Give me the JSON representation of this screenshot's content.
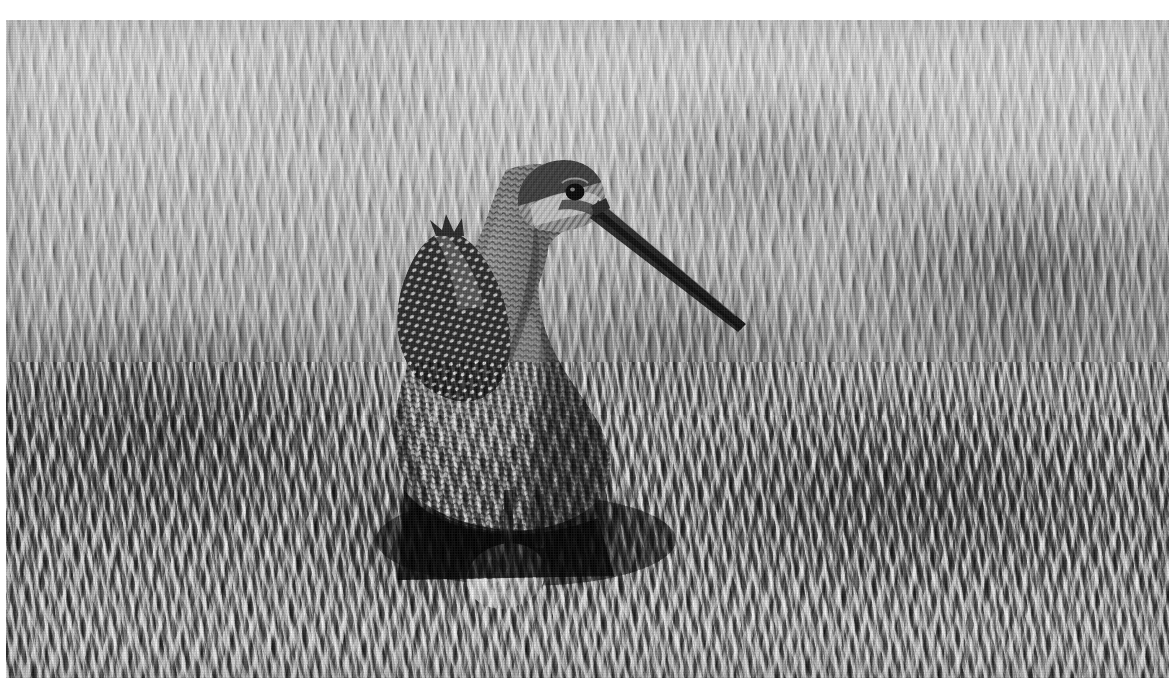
{
  "image": {
    "title": "Long-billed shorebird standing over nest in dry prairie grass",
    "medium": "black-and-white halftone photographic print",
    "orientation": "landscape",
    "frame": {
      "canvas_width_px": 1173,
      "canvas_height_px": 698,
      "border_color": "#ffffff",
      "plate_left_px": 6,
      "plate_top_px": 20,
      "plate_width_px": 1163,
      "plate_height_px": 658
    },
    "palette": {
      "highlight": "#e8e8e8",
      "light_grass": "#c9c9c9",
      "mid_grass": "#9a9a9a",
      "dark_grass": "#4e4e4e",
      "shadow": "#1a1a1a",
      "bird_body": "#8b8b8b",
      "bird_dark": "#2b2b2b",
      "egg": "#cbc6bb"
    }
  },
  "subjects": [
    {
      "name": "shorebird",
      "label": "Long-billed shorebird (godwit / dowitcher type)",
      "pose": "standing upright, facing right, wing raised",
      "position": {
        "x_px": 500,
        "y_px": 330
      },
      "parts": [
        {
          "name": "bill",
          "label": "Long straight dark bill",
          "tip_x_px": 740,
          "tip_y_px": 306,
          "base_x_px": 592,
          "base_y_px": 185
        },
        {
          "name": "eye",
          "label": "Dark round eye",
          "x_px": 569,
          "y_px": 172
        },
        {
          "name": "crown",
          "label": "Streaked crown",
          "x_px": 545,
          "y_px": 155
        },
        {
          "name": "neck",
          "label": "Finely mottled neck",
          "x_px": 520,
          "y_px": 250
        },
        {
          "name": "breast",
          "label": "Barred and speckled breast",
          "x_px": 500,
          "y_px": 360
        },
        {
          "name": "wing",
          "label": "Raised barred scapular feathers",
          "x_px": 440,
          "y_px": 260
        },
        {
          "name": "legs",
          "label": "Legs hidden in shadow under body",
          "x_px": 505,
          "y_px": 470
        }
      ]
    },
    {
      "name": "egg",
      "label": "Pale speckled egg in nest scrape",
      "position": {
        "x_px": 500,
        "y_px": 556
      },
      "size": {
        "width_px": 78,
        "height_px": 62
      }
    }
  ],
  "background": {
    "name": "grass-field",
    "label": "Dense dry prairie grass, sunlit and out of focus toward the top",
    "zones": [
      {
        "name": "upper-haze",
        "label": "Bright blurred grass heads",
        "tone": "light"
      },
      {
        "name": "mid-band",
        "label": "Mid-tone standing stems",
        "tone": "medium"
      },
      {
        "name": "lower-tangle",
        "label": "Dark tangled grass litter",
        "tone": "dark"
      }
    ]
  }
}
